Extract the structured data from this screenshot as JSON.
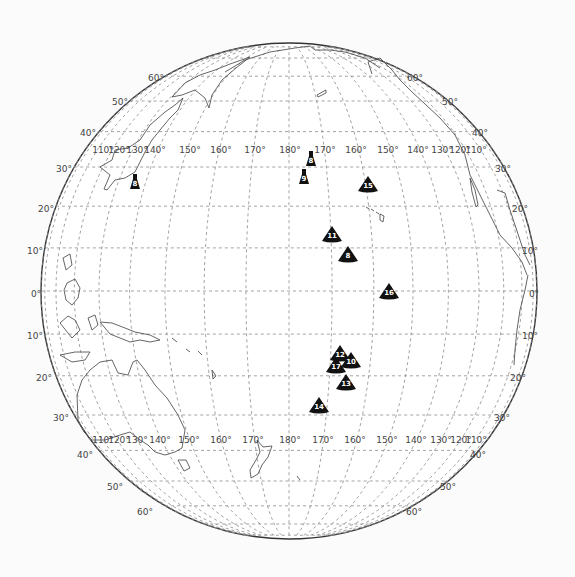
{
  "map": {
    "projection": "orthographic",
    "center_lon": 180,
    "center_lat": 0,
    "globe": {
      "cx": 289,
      "cy": 291,
      "r": 248
    },
    "colors": {
      "background": "#fbfbfb",
      "globe_fill": "#ffffff",
      "border": "#333333",
      "graticule": "#8a8a8a",
      "coastline": "#555555",
      "marker": "#111111",
      "marker_text": "#ffffff",
      "label": "#444444"
    },
    "latitude_labels": [
      {
        "text": "60°",
        "x": 156,
        "y": 78
      },
      {
        "text": "50°",
        "x": 120,
        "y": 102
      },
      {
        "text": "40°",
        "x": 88,
        "y": 133
      },
      {
        "text": "30°",
        "x": 64,
        "y": 169
      },
      {
        "text": "20°",
        "x": 46,
        "y": 209
      },
      {
        "text": "10°",
        "x": 35,
        "y": 251
      },
      {
        "text": "0°",
        "x": 36,
        "y": 294
      },
      {
        "text": "10°",
        "x": 35,
        "y": 336
      },
      {
        "text": "20°",
        "x": 44,
        "y": 378
      },
      {
        "text": "30°",
        "x": 61,
        "y": 418
      },
      {
        "text": "40°",
        "x": 85,
        "y": 455
      },
      {
        "text": "50°",
        "x": 115,
        "y": 487
      },
      {
        "text": "60°",
        "x": 145,
        "y": 512
      },
      {
        "text": "60°",
        "x": 415,
        "y": 78
      },
      {
        "text": "50°",
        "x": 450,
        "y": 102
      },
      {
        "text": "40°",
        "x": 480,
        "y": 133
      },
      {
        "text": "30°",
        "x": 503,
        "y": 169
      },
      {
        "text": "20°",
        "x": 520,
        "y": 209
      },
      {
        "text": "10°",
        "x": 530,
        "y": 251
      },
      {
        "text": "0°",
        "x": 534,
        "y": 294
      },
      {
        "text": "10°",
        "x": 530,
        "y": 336
      },
      {
        "text": "20°",
        "x": 518,
        "y": 378
      },
      {
        "text": "30°",
        "x": 502,
        "y": 418
      },
      {
        "text": "40°",
        "x": 478,
        "y": 455
      },
      {
        "text": "50°",
        "x": 448,
        "y": 487
      },
      {
        "text": "60°",
        "x": 414,
        "y": 512
      }
    ],
    "longitude_labels_top": {
      "y": 150,
      "items": [
        {
          "text": "110°",
          "x": 103
        },
        {
          "text": "120°",
          "x": 119
        },
        {
          "text": "130°",
          "x": 137
        },
        {
          "text": "140°",
          "x": 155
        },
        {
          "text": "150°",
          "x": 190
        },
        {
          "text": "160°",
          "x": 221
        },
        {
          "text": "170°",
          "x": 255
        },
        {
          "text": "180°",
          "x": 290
        },
        {
          "text": "170°",
          "x": 325
        },
        {
          "text": "160°",
          "x": 356
        },
        {
          "text": "150°",
          "x": 388
        },
        {
          "text": "140°",
          "x": 418
        },
        {
          "text": "130°",
          "x": 442
        },
        {
          "text": "120°",
          "x": 460
        },
        {
          "text": "110°",
          "x": 476
        }
      ]
    },
    "longitude_labels_bottom": {
      "y": 440,
      "items": [
        {
          "text": "110°",
          "x": 103
        },
        {
          "text": "120°",
          "x": 119
        },
        {
          "text": "130°",
          "x": 137
        },
        {
          "text": "140°",
          "x": 160
        },
        {
          "text": "150°",
          "x": 189
        },
        {
          "text": "160°",
          "x": 221
        },
        {
          "text": "170°",
          "x": 253
        },
        {
          "text": "180°",
          "x": 290
        },
        {
          "text": "170°",
          "x": 323
        },
        {
          "text": "160°",
          "x": 355
        },
        {
          "text": "150°",
          "x": 387
        },
        {
          "text": "140°",
          "x": 416
        },
        {
          "text": "130°",
          "x": 441
        },
        {
          "text": "120°",
          "x": 461
        },
        {
          "text": "110°",
          "x": 476
        }
      ]
    },
    "markers": [
      {
        "id": "8",
        "shape": "bell",
        "x": 135,
        "y": 183
      },
      {
        "id": "8",
        "shape": "bell",
        "x": 311,
        "y": 160
      },
      {
        "id": "9",
        "shape": "bell",
        "x": 304,
        "y": 178
      },
      {
        "id": "15",
        "shape": "triangle",
        "x": 368,
        "y": 185
      },
      {
        "id": "11",
        "shape": "triangle",
        "x": 332,
        "y": 235
      },
      {
        "id": "8",
        "shape": "triangle",
        "x": 348,
        "y": 255
      },
      {
        "id": "16",
        "shape": "triangle",
        "x": 389,
        "y": 292
      },
      {
        "id": "12",
        "shape": "triangle",
        "x": 340,
        "y": 354
      },
      {
        "id": "10",
        "shape": "triangle",
        "x": 351,
        "y": 361
      },
      {
        "id": "17",
        "shape": "triangle",
        "x": 336,
        "y": 366
      },
      {
        "id": "13",
        "shape": "triangle",
        "x": 346,
        "y": 383
      },
      {
        "id": "14",
        "shape": "triangle",
        "x": 319,
        "y": 406
      }
    ]
  }
}
